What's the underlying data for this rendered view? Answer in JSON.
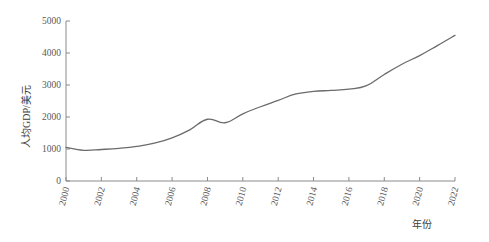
{
  "chart_data": {
    "type": "line",
    "title": "",
    "xlabel": "年份",
    "ylabel": "人均GDP/美元",
    "xlim": [
      2000,
      2022
    ],
    "ylim": [
      0,
      5000
    ],
    "grid": false,
    "legend": "none",
    "xtick_labels": [
      "2000",
      "2002",
      "2004",
      "2006",
      "2008",
      "2010",
      "2012",
      "2014",
      "2016",
      "2018",
      "2020",
      "2022"
    ],
    "ytick_labels": [
      "0",
      "1000",
      "2000",
      "3000",
      "4000",
      "5000"
    ],
    "ytick_values": [
      0,
      1000,
      2000,
      3000,
      4000,
      5000
    ],
    "xtick_values": [
      2000,
      2002,
      2004,
      2006,
      2008,
      2010,
      2012,
      2014,
      2016,
      2018,
      2020,
      2022
    ],
    "series": [
      {
        "name": "人均GDP",
        "color": "#6b6b6b",
        "x": [
          2000,
          2001,
          2002,
          2003,
          2004,
          2005,
          2006,
          2007,
          2008,
          2009,
          2010,
          2011,
          2012,
          2013,
          2014,
          2015,
          2016,
          2017,
          2018,
          2019,
          2020,
          2021,
          2022
        ],
        "values": [
          1050,
          960,
          985,
          1020,
          1080,
          1180,
          1350,
          1600,
          1930,
          1820,
          2100,
          2320,
          2520,
          2720,
          2800,
          2830,
          2870,
          2980,
          3330,
          3650,
          3920,
          4230,
          4550
        ]
      }
    ]
  }
}
